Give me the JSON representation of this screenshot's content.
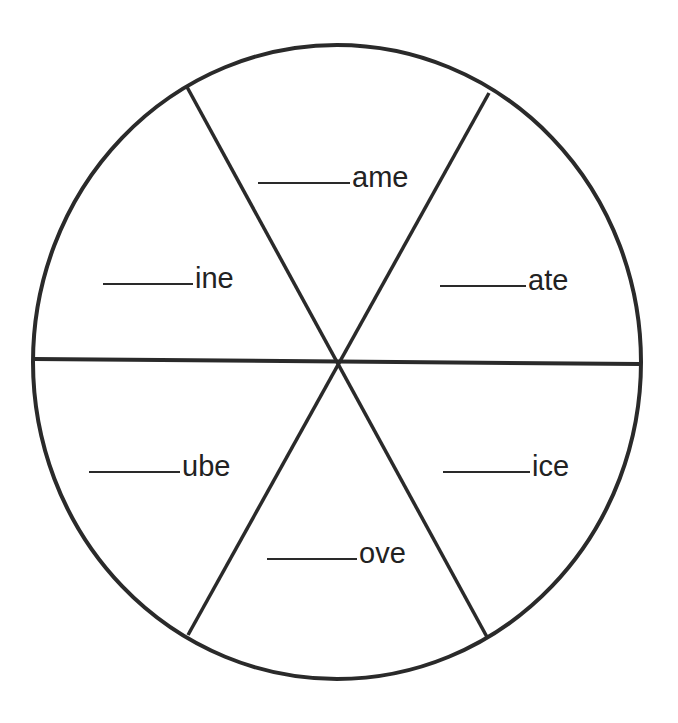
{
  "worksheet": {
    "type": "word-family wheel",
    "instruction_visible": false,
    "stroke_color": "#2a2a2a",
    "text_color": "#222222",
    "background": "#ffffff",
    "wheel": {
      "center": [
        340,
        362
      ],
      "radius": 305,
      "segments": 6
    },
    "sections": [
      {
        "position": "top",
        "blank": "",
        "suffix": "ame"
      },
      {
        "position": "upper-right",
        "blank": "",
        "suffix": "ate"
      },
      {
        "position": "lower-right",
        "blank": "",
        "suffix": "ice"
      },
      {
        "position": "bottom",
        "blank": "",
        "suffix": "ove"
      },
      {
        "position": "lower-left",
        "blank": "",
        "suffix": "ube"
      },
      {
        "position": "upper-left",
        "blank": "",
        "suffix": "ine"
      }
    ]
  }
}
